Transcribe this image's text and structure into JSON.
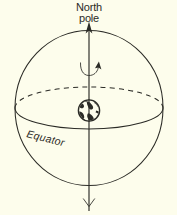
{
  "figure": {
    "name": "earth-celestial-sphere-diagram",
    "background_color": "#fdfdec",
    "ink_color": "#2b2b26",
    "labels": {
      "north_pole_line1": "North",
      "north_pole_line2": "pole",
      "equator": "Equator"
    },
    "elements": {
      "sphere_name": "celestial-sphere",
      "axis_name": "rotation-axis",
      "equator_front_name": "equator-front-arc",
      "equator_back_name": "equator-back-arc-dashed",
      "earth_name": "earth-globe",
      "rotation_arrow_name": "rotation-direction-arrow",
      "axis_arrowhead_name": "axis-arrowhead",
      "axis_fletching_name": "axis-fletching"
    },
    "geometry": {
      "sphere_center_x": 89,
      "sphere_center_y": 108,
      "sphere_radius_x": 74,
      "sphere_radius_y": 77,
      "equator_radius_y": 21,
      "axis_top_y": 22,
      "axis_bottom_y": 211,
      "earth_radius": 11
    }
  }
}
